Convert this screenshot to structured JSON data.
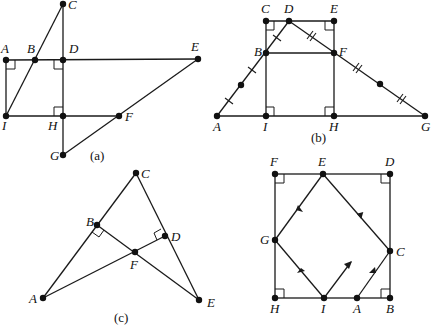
{
  "figures": [
    {
      "id": "a",
      "caption": "(a)",
      "points": {
        "A": {
          "label": "A"
        },
        "B": {
          "label": "B"
        },
        "C": {
          "label": "C"
        },
        "D": {
          "label": "D"
        },
        "E": {
          "label": "E"
        },
        "F": {
          "label": "F"
        },
        "G": {
          "label": "G"
        },
        "H": {
          "label": "H"
        },
        "I": {
          "label": "I"
        }
      },
      "segments": [
        "A-E",
        "A-I",
        "I-C",
        "C-G",
        "I-F",
        "E-G"
      ],
      "right_angles": [
        "A",
        "D",
        "H"
      ]
    },
    {
      "id": "b",
      "caption": "(b)",
      "points": {
        "A": {
          "label": "A"
        },
        "B": {
          "label": "B"
        },
        "C": {
          "label": "C"
        },
        "D": {
          "label": "D"
        },
        "E": {
          "label": "E"
        },
        "F": {
          "label": "F"
        },
        "G": {
          "label": "G"
        },
        "H": {
          "label": "H"
        },
        "I": {
          "label": "I"
        }
      },
      "segments": [
        "A-G",
        "A-D",
        "D-G",
        "C-E",
        "C-I",
        "E-H",
        "B-F"
      ],
      "right_angles": [
        "C",
        "E",
        "I",
        "H"
      ],
      "equal_marks": {
        "single": [
          "A-mid",
          "mid-B",
          "B-D"
        ],
        "double": [
          "D-F",
          "F-mid",
          "mid-G"
        ]
      }
    },
    {
      "id": "c",
      "caption": "(c)",
      "points": {
        "A": {
          "label": "A"
        },
        "B": {
          "label": "B"
        },
        "C": {
          "label": "C"
        },
        "D": {
          "label": "D"
        },
        "E": {
          "label": "E"
        },
        "F": {
          "label": "F"
        }
      },
      "segments": [
        "A-C",
        "C-E",
        "A-D",
        "B-E"
      ],
      "right_angles": [
        "B",
        "D"
      ]
    },
    {
      "id": "d",
      "caption": "",
      "points": {
        "A": {
          "label": "A"
        },
        "B": {
          "label": "B"
        },
        "C": {
          "label": "C"
        },
        "D": {
          "label": "D"
        },
        "E": {
          "label": "E"
        },
        "F": {
          "label": "F"
        },
        "G": {
          "label": "G"
        },
        "H": {
          "label": "H"
        },
        "I": {
          "label": "I"
        }
      },
      "segments": [
        "F-D",
        "D-B",
        "B-H",
        "H-F",
        "A-C",
        "C-E",
        "E-G",
        "G-I",
        "I-ray"
      ],
      "right_angles": [
        "F",
        "D",
        "H",
        "B"
      ],
      "path_direction": "A → C → E → G → I → ray"
    }
  ]
}
